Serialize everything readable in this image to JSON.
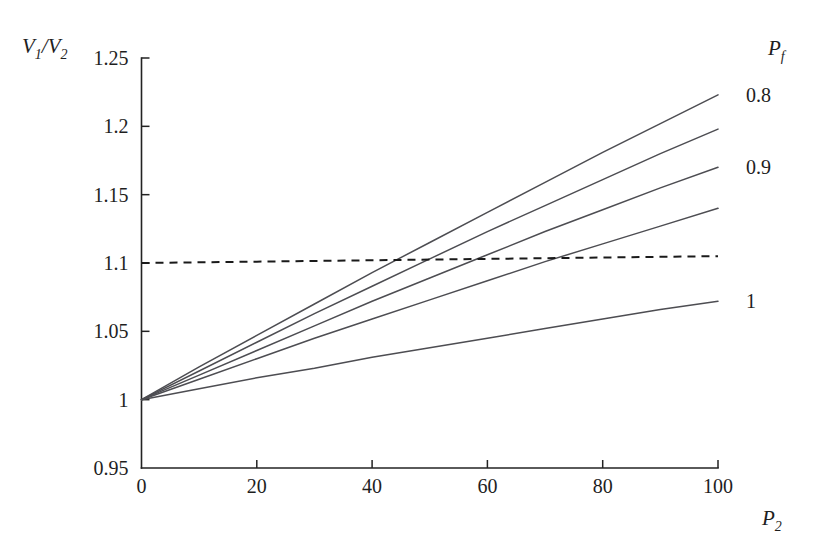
{
  "chart_data": {
    "type": "line",
    "title": "",
    "subtitle": "",
    "xlabel": "P_2",
    "xlabel_base": "P",
    "xlabel_sub": "2",
    "ylabel": "V_1/V_2",
    "ylabel_num_base": "V",
    "ylabel_num_sub": "1",
    "ylabel_slash": "/",
    "ylabel_den_base": "V",
    "ylabel_den_sub": "2",
    "xlim": [
      0,
      100
    ],
    "ylim": [
      0.95,
      1.25
    ],
    "xticks": [
      0,
      20,
      40,
      60,
      80,
      100
    ],
    "xticklabels": [
      "0",
      "20",
      "40",
      "60",
      "80",
      "100"
    ],
    "yticks": [
      0.95,
      1.0,
      1.05,
      1.1,
      1.15,
      1.2,
      1.25
    ],
    "yticklabels": [
      "0.95",
      "1",
      "1.05",
      "1.1",
      "1.15",
      "1.2",
      "1.25"
    ],
    "grid": false,
    "legend_position": "right-outside",
    "legend_title": "P_f",
    "legend_title_base": "P",
    "legend_title_sub": "f",
    "legend_labels": [
      "0.8",
      "0.9",
      "1"
    ],
    "line_color": "#4d4d52",
    "refline_color": "#1a1a1a",
    "axis_color": "#232323",
    "background": "#ffffff",
    "x": [
      0,
      10,
      20,
      30,
      40,
      50,
      60,
      70,
      80,
      90,
      100
    ],
    "series": [
      {
        "name": "0.8",
        "label": "0.8",
        "style": "solid",
        "values": [
          1.0,
          1.024,
          1.047,
          1.07,
          1.093,
          1.115,
          1.137,
          1.159,
          1.181,
          1.202,
          1.223
        ]
      },
      {
        "name": "s2",
        "label": "",
        "style": "solid",
        "values": [
          1.0,
          1.021,
          1.042,
          1.063,
          1.083,
          1.103,
          1.123,
          1.142,
          1.161,
          1.18,
          1.198
        ]
      },
      {
        "name": "0.9",
        "label": "0.9",
        "style": "solid",
        "values": [
          1.0,
          1.018,
          1.036,
          1.054,
          1.072,
          1.089,
          1.106,
          1.123,
          1.139,
          1.155,
          1.17
        ]
      },
      {
        "name": "s4",
        "label": "",
        "style": "solid",
        "values": [
          1.0,
          1.015,
          1.03,
          1.045,
          1.059,
          1.073,
          1.087,
          1.101,
          1.114,
          1.127,
          1.14
        ]
      },
      {
        "name": "1",
        "label": "1",
        "style": "solid",
        "values": [
          1.0,
          1.008,
          1.016,
          1.023,
          1.031,
          1.038,
          1.045,
          1.052,
          1.059,
          1.066,
          1.072
        ]
      }
    ],
    "reference_line": {
      "name": "threshold",
      "style": "dashed",
      "values": [
        1.1,
        1.1005,
        1.101,
        1.1015,
        1.102,
        1.1025,
        1.103,
        1.1035,
        1.104,
        1.1045,
        1.105
      ]
    }
  }
}
